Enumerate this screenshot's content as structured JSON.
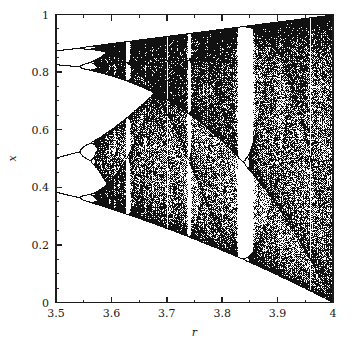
{
  "figure": {
    "name": "logistic-map-bifurcation-diagram",
    "background_color": "#ffffff",
    "ink_color": "#111111",
    "width": 352,
    "height": 349
  },
  "chart_data": {
    "type": "scatter",
    "title": "",
    "subtitle": "",
    "xlabel": "r",
    "ylabel": "x",
    "xlim": [
      3.5,
      4.0
    ],
    "ylim": [
      0.0,
      1.0
    ],
    "grid": false,
    "legend": null,
    "legend_position": "none",
    "x_ticks": [
      3.5,
      3.6,
      3.7,
      3.8,
      3.9,
      4.0
    ],
    "x_tick_labels": [
      "3.5",
      "3.6",
      "3.7",
      "3.8",
      "3.9",
      "4"
    ],
    "x_minor_tick_step": 0.05,
    "y_ticks": [
      0.0,
      0.2,
      0.4,
      0.6,
      0.8,
      1.0
    ],
    "y_tick_labels": [
      "0",
      "0.2",
      "0.4",
      "0.6",
      "0.8",
      "1"
    ],
    "y_minor_tick_step": 0.05,
    "tick_direction": "in",
    "map_equation": "x_{n+1} = r x_n (1 - x_n)",
    "r_start": 3.5,
    "r_end": 4.0,
    "r_samples": 700,
    "transient_iterations": 320,
    "plotted_iterations": 220,
    "seed_x0": 0.4,
    "annotations": [
      {
        "label": "period-4 band (upper)",
        "r": 3.5,
        "x": 0.875
      },
      {
        "label": "period-4 band (upper-mid)",
        "r": 3.5,
        "x": 0.827
      },
      {
        "label": "period-4 band (lower-mid)",
        "r": 3.5,
        "x": 0.5
      },
      {
        "label": "period-4 band (lower)",
        "r": 3.5,
        "x": 0.383
      },
      {
        "label": "period-3 window",
        "r": 3.835,
        "x": 0.5
      },
      {
        "label": "full attractor at r = 4",
        "r": 4.0,
        "x": 0.5
      }
    ],
    "upper_envelope": [
      {
        "r": 3.5,
        "x": 0.875
      },
      {
        "r": 3.55,
        "x": 0.8874
      },
      {
        "r": 3.6,
        "x": 0.8999
      },
      {
        "r": 3.65,
        "x": 0.9075
      },
      {
        "r": 3.7,
        "x": 0.925
      },
      {
        "r": 3.75,
        "x": 0.9375
      },
      {
        "r": 3.8,
        "x": 0.95
      },
      {
        "r": 3.85,
        "x": 0.9625
      },
      {
        "r": 3.9,
        "x": 0.975
      },
      {
        "r": 3.95,
        "x": 0.9875
      },
      {
        "r": 4.0,
        "x": 1.0
      }
    ],
    "lower_envelope": [
      {
        "r": 3.5,
        "x": 0.3828
      },
      {
        "r": 3.55,
        "x": 0.3548
      },
      {
        "r": 3.6,
        "x": 0.3239
      },
      {
        "r": 3.65,
        "x": 0.3006
      },
      {
        "r": 3.7,
        "x": 0.2567
      },
      {
        "r": 3.75,
        "x": 0.2197
      },
      {
        "r": 3.8,
        "x": 0.1805
      },
      {
        "r": 3.85,
        "x": 0.1391
      },
      {
        "r": 3.9,
        "x": 0.0954
      },
      {
        "r": 3.95,
        "x": 0.0494
      },
      {
        "r": 4.0,
        "x": 0.0
      }
    ]
  },
  "axes": {
    "x_title": "r",
    "y_title": "x"
  }
}
